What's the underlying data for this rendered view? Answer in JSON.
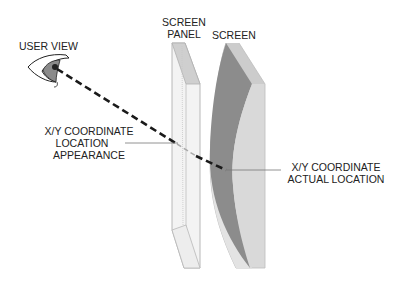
{
  "diagram": {
    "labels": {
      "user_view": "USER VIEW",
      "screen_panel_line1": "SCREEN",
      "screen_panel_line2": "PANEL",
      "screen": "SCREEN",
      "apparent_line1": "X/Y COORDINATE",
      "apparent_line2": "LOCATION",
      "apparent_line3": "APPEARANCE",
      "actual_line1": "X/Y COORDINATE",
      "actual_line2": "ACTUAL LOCATION"
    },
    "colors": {
      "screen_dark": "#8a8a8a",
      "screen_light": "#d4d4d4",
      "panel_fill": "#f2f2f2",
      "panel_edge": "#bdbdbd",
      "line": "#1a1a1a",
      "leader": "#777777"
    }
  }
}
